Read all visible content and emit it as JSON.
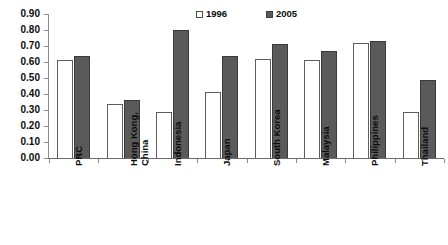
{
  "chart_data": {
    "type": "bar",
    "title": "",
    "xlabel": "",
    "ylabel": "",
    "ylim": [
      0.0,
      0.9
    ],
    "ytick_step": 0.1,
    "grid": false,
    "legend_position": "top-center",
    "categories": [
      "PRC",
      "Hong Kong,\nChina",
      "Indonesia",
      "Japan",
      "South Korea",
      "Malaysia",
      "Philippines",
      "Thailand"
    ],
    "ytick_labels": [
      "0.90",
      "0.80",
      "0.70",
      "0.60",
      "0.50",
      "0.40",
      "0.30",
      "0.20",
      "0.10",
      "0.00"
    ],
    "ytick_values": [
      0.9,
      0.8,
      0.7,
      0.6,
      0.5,
      0.4,
      0.3,
      0.2,
      0.1,
      0.0
    ],
    "series": [
      {
        "name": "1996",
        "color": "#ffffff",
        "border_color": "#5e5e5e",
        "values": [
          0.61,
          0.34,
          0.29,
          0.41,
          0.62,
          0.61,
          0.72,
          0.29
        ]
      },
      {
        "name": "2005",
        "color": "#5a5a5a",
        "border_color": "#3a3a3a",
        "values": [
          0.64,
          0.36,
          0.8,
          0.64,
          0.71,
          0.67,
          0.73,
          0.49
        ]
      }
    ]
  },
  "legend": {
    "entries": [
      {
        "label": "1996",
        "style": "hollow"
      },
      {
        "label": "2005",
        "style": "filled"
      }
    ]
  }
}
